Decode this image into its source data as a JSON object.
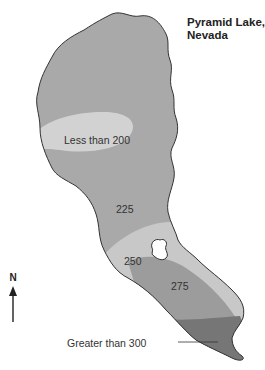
{
  "title": {
    "line1": "Pyramid Lake,",
    "line2": "Nevada"
  },
  "north_arrow": {
    "label": "N"
  },
  "contours": {
    "less_than_200": "Less than 200",
    "c225": "225",
    "c250": "250",
    "c275": "275",
    "greater_than_300": "Greater than 300"
  },
  "colors": {
    "outer_zone": "#a9a9a9",
    "shallow_zone": "#d2d2d2",
    "zone_250": "#c8c8c8",
    "zone_275": "#9c9c9c",
    "zone_300": "#767676",
    "outline": "#333333"
  }
}
